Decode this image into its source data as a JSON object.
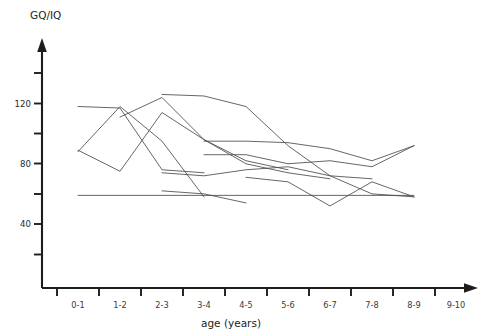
{
  "chart_data": {
    "type": "line",
    "title": "",
    "ylabel": "GQ/IQ",
    "xlabel": "age (years)",
    "grid": false,
    "legend": "none",
    "categories": [
      "0-1",
      "1-2",
      "2-3",
      "3-4",
      "4-5",
      "5-6",
      "6-7",
      "7-8",
      "8-9",
      "9-10"
    ],
    "x_tick_labels": [
      "0-1",
      "1-2",
      "2-3",
      "3-4",
      "4-5",
      "5-6",
      "6-7",
      "7-8",
      "8-9",
      "9-10"
    ],
    "y_tick_labels": [
      "40",
      "80",
      "120"
    ],
    "y_major_ticks": [
      40,
      80,
      120
    ],
    "y_minor_ticks": [
      20,
      60,
      100,
      140
    ],
    "ylim": [
      0,
      152
    ],
    "xlim": [
      -0.55,
      9.9
    ],
    "line_color": "#4a4a4a",
    "axis_color": "#1d1d1b",
    "background": "#ffffff",
    "note": "Spaghetti plot of individual developmental quotient trajectories; each line is one subject followed over consecutive age bands.",
    "series": [
      {
        "name": "subject-1",
        "x": [
          "0-1",
          "1-2",
          "2-3",
          "3-4"
        ],
        "values": [
          88,
          118,
          95,
          58
        ]
      },
      {
        "name": "subject-2",
        "x": [
          "0-1",
          "1-2",
          "2-3",
          "3-4"
        ],
        "values": [
          118,
          117,
          76,
          74
        ]
      },
      {
        "name": "subject-3",
        "x": [
          "0-1",
          "1-2",
          "2-3",
          "3-4",
          "4-5",
          "5-6"
        ],
        "values": [
          89,
          75,
          114,
          96,
          82,
          76
        ]
      },
      {
        "name": "subject-4",
        "x": [
          "1-2",
          "2-3",
          "3-4",
          "4-5",
          "5-6",
          "6-7"
        ],
        "values": [
          111,
          124,
          96,
          80,
          74,
          70
        ]
      },
      {
        "name": "subject-5",
        "x": [
          "2-3",
          "3-4",
          "4-5",
          "5-6",
          "6-7",
          "7-8"
        ],
        "values": [
          126,
          125,
          118,
          92,
          72,
          70
        ]
      },
      {
        "name": "subject-6",
        "x": [
          "3-4",
          "4-5",
          "5-6",
          "6-7",
          "7-8",
          "8-9"
        ],
        "values": [
          95,
          95,
          94,
          90,
          82,
          92
        ]
      },
      {
        "name": "subject-7",
        "x": [
          "3-4",
          "4-5",
          "5-6",
          "6-7",
          "7-8",
          "8-9"
        ],
        "values": [
          86,
          86,
          80,
          82,
          78,
          92
        ]
      },
      {
        "name": "subject-8",
        "x": [
          "2-3",
          "3-4",
          "4-5",
          "5-6",
          "6-7",
          "7-8",
          "8-9"
        ],
        "values": [
          74,
          72,
          76,
          78,
          72,
          60,
          58
        ]
      },
      {
        "name": "subject-9",
        "x": [
          "4-5",
          "5-6",
          "6-7",
          "7-8",
          "8-9"
        ],
        "values": [
          71,
          68,
          52,
          68,
          58
        ]
      },
      {
        "name": "subject-10",
        "x": [
          "0-1",
          "1-2",
          "2-3",
          "3-4",
          "4-5",
          "5-6",
          "6-7",
          "7-8",
          "8-9"
        ],
        "values": [
          59,
          59,
          59,
          59,
          59,
          59,
          59,
          59,
          59
        ]
      },
      {
        "name": "subject-11",
        "x": [
          "2-3",
          "3-4",
          "4-5"
        ],
        "values": [
          62,
          60,
          54
        ]
      }
    ]
  }
}
